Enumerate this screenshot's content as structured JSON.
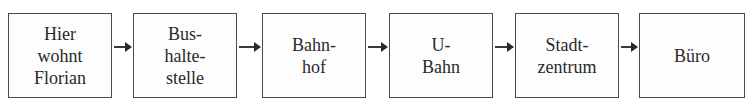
{
  "diagram": {
    "type": "flow",
    "direction": "left-to-right",
    "steps": [
      {
        "id": "step-1",
        "label": "Hier\nwohnt\nFlorian"
      },
      {
        "id": "step-2",
        "label": "Bus-\nhalte-\nstelle"
      },
      {
        "id": "step-3",
        "label": "Bahn-\nhof"
      },
      {
        "id": "step-4",
        "label": "U-\nBahn"
      },
      {
        "id": "step-5",
        "label": "Stadt-\nzentrum"
      },
      {
        "id": "step-6",
        "label": "Büro"
      }
    ],
    "connections": [
      {
        "from": "step-1",
        "to": "step-2"
      },
      {
        "from": "step-2",
        "to": "step-3"
      },
      {
        "from": "step-3",
        "to": "step-4"
      },
      {
        "from": "step-4",
        "to": "step-5"
      },
      {
        "from": "step-5",
        "to": "step-6"
      }
    ],
    "colors": {
      "border": "#4a4a4a",
      "text": "#2a2a2a",
      "arrow": "#3a3a3a",
      "background": "#ffffff"
    }
  }
}
